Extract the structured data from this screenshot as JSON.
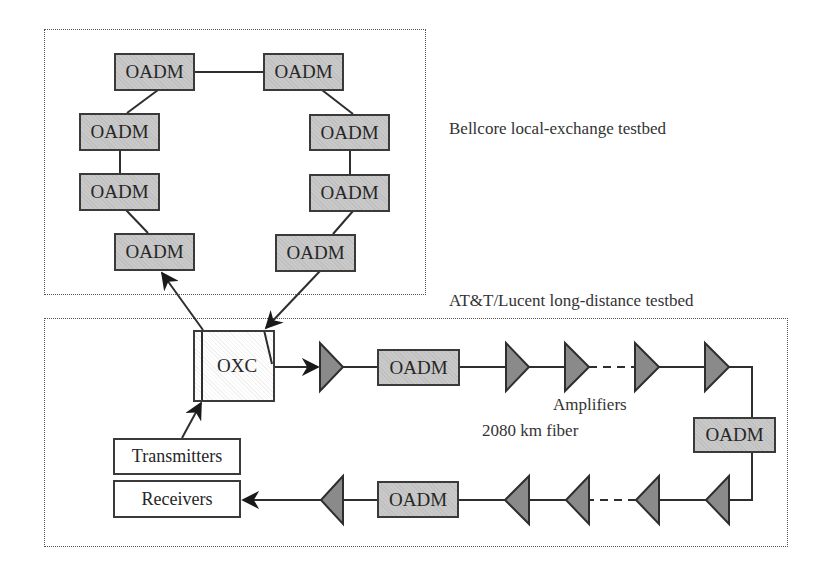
{
  "diagram": {
    "type": "network-testbed",
    "regions": {
      "local": {
        "label": "Bellcore local-exchange testbed"
      },
      "longdistance": {
        "label": "AT&T/Lucent long-distance testbed"
      }
    },
    "ring_nodes": [
      {
        "id": "ring-1",
        "label": "OADM"
      },
      {
        "id": "ring-2",
        "label": "OADM"
      },
      {
        "id": "ring-3",
        "label": "OADM"
      },
      {
        "id": "ring-4",
        "label": "OADM"
      },
      {
        "id": "ring-5",
        "label": "OADM"
      },
      {
        "id": "ring-6",
        "label": "OADM"
      },
      {
        "id": "ring-7",
        "label": "OADM"
      },
      {
        "id": "ring-8",
        "label": "OADM"
      }
    ],
    "oxc": {
      "label": "OXC"
    },
    "line_oadms": [
      {
        "id": "line-oadm-top",
        "label": "OADM"
      },
      {
        "id": "line-oadm-right",
        "label": "OADM"
      },
      {
        "id": "line-oadm-bottom",
        "label": "OADM"
      }
    ],
    "terminals": {
      "transmitters": "Transmitters",
      "receivers": "Receivers"
    },
    "annotations": {
      "amplifiers": "Amplifiers",
      "fiber": "2080 km fiber"
    },
    "colors": {
      "oadm_fill": "#c9c9c9",
      "amplifier_fill": "#8a8a8a",
      "stroke": "#3a3a3a"
    }
  }
}
